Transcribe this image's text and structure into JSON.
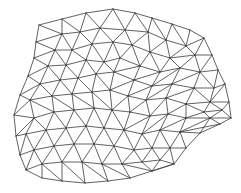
{
  "diagram": {
    "type": "triangular-mesh",
    "stroke_color": "#3a3a3a",
    "background": "#ffffff",
    "vertices": [
      [
        39,
        25
      ],
      [
        62,
        19
      ],
      [
        86,
        13
      ],
      [
        113,
        9
      ],
      [
        135,
        13
      ],
      [
        152,
        18
      ],
      [
        172,
        24
      ],
      [
        190,
        30
      ],
      [
        204,
        38
      ],
      [
        212,
        55
      ],
      [
        218,
        70
      ],
      [
        225,
        84
      ],
      [
        229,
        102
      ],
      [
        231,
        118
      ],
      [
        220,
        124
      ],
      [
        200,
        133
      ],
      [
        186,
        148
      ],
      [
        174,
        164
      ],
      [
        152,
        171
      ],
      [
        130,
        178
      ],
      [
        108,
        181
      ],
      [
        85,
        183
      ],
      [
        62,
        181
      ],
      [
        42,
        178
      ],
      [
        26,
        170
      ],
      [
        20,
        155
      ],
      [
        16,
        136
      ],
      [
        14,
        115
      ],
      [
        20,
        95
      ],
      [
        28,
        76
      ],
      [
        34,
        58
      ],
      [
        36,
        42
      ],
      [
        62,
        34
      ],
      [
        80,
        32
      ],
      [
        100,
        28
      ],
      [
        125,
        30
      ],
      [
        148,
        32
      ],
      [
        166,
        40
      ],
      [
        186,
        46
      ],
      [
        55,
        50
      ],
      [
        72,
        50
      ],
      [
        92,
        44
      ],
      [
        113,
        42
      ],
      [
        132,
        45
      ],
      [
        150,
        52
      ],
      [
        170,
        58
      ],
      [
        195,
        55
      ],
      [
        48,
        66
      ],
      [
        66,
        65
      ],
      [
        86,
        60
      ],
      [
        104,
        62
      ],
      [
        120,
        58
      ],
      [
        140,
        66
      ],
      [
        160,
        72
      ],
      [
        180,
        68
      ],
      [
        200,
        72
      ],
      [
        214,
        88
      ],
      [
        40,
        84
      ],
      [
        60,
        80
      ],
      [
        78,
        78
      ],
      [
        96,
        74
      ],
      [
        114,
        72
      ],
      [
        134,
        80
      ],
      [
        152,
        86
      ],
      [
        172,
        84
      ],
      [
        194,
        88
      ],
      [
        210,
        102
      ],
      [
        30,
        100
      ],
      [
        52,
        96
      ],
      [
        72,
        94
      ],
      [
        92,
        92
      ],
      [
        110,
        90
      ],
      [
        128,
        96
      ],
      [
        146,
        100
      ],
      [
        166,
        98
      ],
      [
        186,
        104
      ],
      [
        204,
        112
      ],
      [
        222,
        110
      ],
      [
        34,
        118
      ],
      [
        54,
        112
      ],
      [
        74,
        110
      ],
      [
        94,
        108
      ],
      [
        112,
        110
      ],
      [
        130,
        112
      ],
      [
        150,
        116
      ],
      [
        168,
        114
      ],
      [
        186,
        118
      ],
      [
        210,
        118
      ],
      [
        26,
        134
      ],
      [
        46,
        130
      ],
      [
        66,
        128
      ],
      [
        86,
        126
      ],
      [
        104,
        128
      ],
      [
        124,
        130
      ],
      [
        142,
        134
      ],
      [
        160,
        130
      ],
      [
        180,
        132
      ],
      [
        34,
        150
      ],
      [
        54,
        146
      ],
      [
        74,
        144
      ],
      [
        94,
        144
      ],
      [
        114,
        146
      ],
      [
        134,
        150
      ],
      [
        152,
        148
      ],
      [
        170,
        148
      ],
      [
        42,
        164
      ],
      [
        62,
        162
      ],
      [
        82,
        162
      ],
      [
        102,
        164
      ],
      [
        122,
        164
      ],
      [
        142,
        162
      ],
      [
        160,
        160
      ]
    ],
    "edges": [
      [
        0,
        1
      ],
      [
        1,
        2
      ],
      [
        2,
        3
      ],
      [
        3,
        4
      ],
      [
        4,
        5
      ],
      [
        5,
        6
      ],
      [
        6,
        7
      ],
      [
        7,
        8
      ],
      [
        8,
        9
      ],
      [
        9,
        10
      ],
      [
        10,
        11
      ],
      [
        11,
        12
      ],
      [
        12,
        13
      ],
      [
        13,
        14
      ],
      [
        14,
        15
      ],
      [
        15,
        16
      ],
      [
        16,
        17
      ],
      [
        17,
        18
      ],
      [
        18,
        19
      ],
      [
        19,
        20
      ],
      [
        20,
        21
      ],
      [
        21,
        22
      ],
      [
        22,
        23
      ],
      [
        23,
        24
      ],
      [
        24,
        25
      ],
      [
        25,
        26
      ],
      [
        26,
        27
      ],
      [
        27,
        28
      ],
      [
        28,
        29
      ],
      [
        29,
        30
      ],
      [
        30,
        31
      ],
      [
        31,
        0
      ],
      [
        0,
        32
      ],
      [
        1,
        32
      ],
      [
        1,
        33
      ],
      [
        2,
        33
      ],
      [
        2,
        34
      ],
      [
        3,
        34
      ],
      [
        3,
        35
      ],
      [
        4,
        35
      ],
      [
        4,
        36
      ],
      [
        5,
        36
      ],
      [
        5,
        37
      ],
      [
        6,
        37
      ],
      [
        6,
        38
      ],
      [
        7,
        38
      ],
      [
        8,
        38
      ],
      [
        8,
        46
      ],
      [
        9,
        46
      ],
      [
        32,
        33
      ],
      [
        33,
        34
      ],
      [
        34,
        35
      ],
      [
        35,
        36
      ],
      [
        36,
        37
      ],
      [
        37,
        38
      ],
      [
        38,
        46
      ],
      [
        31,
        32
      ],
      [
        31,
        39
      ],
      [
        30,
        39
      ],
      [
        32,
        39
      ],
      [
        32,
        40
      ],
      [
        33,
        40
      ],
      [
        33,
        41
      ],
      [
        34,
        41
      ],
      [
        34,
        42
      ],
      [
        35,
        42
      ],
      [
        35,
        43
      ],
      [
        36,
        43
      ],
      [
        36,
        44
      ],
      [
        37,
        44
      ],
      [
        37,
        45
      ],
      [
        38,
        45
      ],
      [
        45,
        46
      ],
      [
        39,
        40
      ],
      [
        40,
        41
      ],
      [
        41,
        42
      ],
      [
        42,
        43
      ],
      [
        43,
        44
      ],
      [
        44,
        45
      ],
      [
        30,
        47
      ],
      [
        39,
        47
      ],
      [
        39,
        48
      ],
      [
        40,
        48
      ],
      [
        40,
        49
      ],
      [
        41,
        49
      ],
      [
        41,
        50
      ],
      [
        42,
        50
      ],
      [
        42,
        51
      ],
      [
        43,
        51
      ],
      [
        43,
        52
      ],
      [
        44,
        52
      ],
      [
        44,
        53
      ],
      [
        45,
        53
      ],
      [
        45,
        54
      ],
      [
        46,
        54
      ],
      [
        46,
        55
      ],
      [
        9,
        55
      ],
      [
        10,
        55
      ],
      [
        10,
        56
      ],
      [
        55,
        56
      ],
      [
        47,
        48
      ],
      [
        48,
        49
      ],
      [
        49,
        50
      ],
      [
        50,
        51
      ],
      [
        51,
        52
      ],
      [
        52,
        53
      ],
      [
        53,
        54
      ],
      [
        54,
        55
      ],
      [
        29,
        47
      ],
      [
        29,
        57
      ],
      [
        47,
        57
      ],
      [
        47,
        58
      ],
      [
        48,
        58
      ],
      [
        48,
        59
      ],
      [
        49,
        59
      ],
      [
        49,
        60
      ],
      [
        50,
        60
      ],
      [
        50,
        61
      ],
      [
        51,
        61
      ],
      [
        52,
        61
      ],
      [
        52,
        62
      ],
      [
        53,
        62
      ],
      [
        53,
        63
      ],
      [
        54,
        63
      ],
      [
        54,
        64
      ],
      [
        55,
        64
      ],
      [
        55,
        65
      ],
      [
        56,
        65
      ],
      [
        56,
        66
      ],
      [
        11,
        56
      ],
      [
        11,
        66
      ],
      [
        12,
        66
      ],
      [
        57,
        58
      ],
      [
        58,
        59
      ],
      [
        59,
        60
      ],
      [
        60,
        61
      ],
      [
        61,
        62
      ],
      [
        62,
        63
      ],
      [
        63,
        64
      ],
      [
        64,
        65
      ],
      [
        65,
        66
      ],
      [
        28,
        57
      ],
      [
        28,
        67
      ],
      [
        57,
        67
      ],
      [
        57,
        68
      ],
      [
        58,
        68
      ],
      [
        58,
        69
      ],
      [
        59,
        69
      ],
      [
        59,
        70
      ],
      [
        60,
        70
      ],
      [
        60,
        71
      ],
      [
        61,
        71
      ],
      [
        62,
        71
      ],
      [
        62,
        72
      ],
      [
        63,
        72
      ],
      [
        63,
        73
      ],
      [
        64,
        73
      ],
      [
        64,
        74
      ],
      [
        65,
        74
      ],
      [
        65,
        75
      ],
      [
        66,
        75
      ],
      [
        66,
        76
      ],
      [
        66,
        77
      ],
      [
        12,
        77
      ],
      [
        76,
        77
      ],
      [
        67,
        68
      ],
      [
        68,
        69
      ],
      [
        69,
        70
      ],
      [
        70,
        71
      ],
      [
        71,
        72
      ],
      [
        72,
        73
      ],
      [
        73,
        74
      ],
      [
        74,
        75
      ],
      [
        75,
        76
      ],
      [
        27,
        67
      ],
      [
        27,
        78
      ],
      [
        67,
        78
      ],
      [
        67,
        79
      ],
      [
        68,
        79
      ],
      [
        68,
        80
      ],
      [
        69,
        80
      ],
      [
        69,
        81
      ],
      [
        70,
        81
      ],
      [
        70,
        82
      ],
      [
        71,
        82
      ],
      [
        72,
        82
      ],
      [
        72,
        83
      ],
      [
        73,
        83
      ],
      [
        73,
        84
      ],
      [
        74,
        84
      ],
      [
        74,
        85
      ],
      [
        75,
        85
      ],
      [
        75,
        86
      ],
      [
        76,
        86
      ],
      [
        76,
        87
      ],
      [
        77,
        87
      ],
      [
        13,
        87
      ],
      [
        13,
        77
      ],
      [
        14,
        87
      ],
      [
        78,
        79
      ],
      [
        79,
        80
      ],
      [
        80,
        81
      ],
      [
        81,
        82
      ],
      [
        82,
        83
      ],
      [
        83,
        84
      ],
      [
        84,
        85
      ],
      [
        85,
        86
      ],
      [
        86,
        87
      ],
      [
        26,
        78
      ],
      [
        26,
        88
      ],
      [
        78,
        88
      ],
      [
        78,
        89
      ],
      [
        79,
        89
      ],
      [
        79,
        90
      ],
      [
        80,
        90
      ],
      [
        80,
        91
      ],
      [
        81,
        91
      ],
      [
        81,
        92
      ],
      [
        82,
        92
      ],
      [
        82,
        93
      ],
      [
        83,
        93
      ],
      [
        84,
        93
      ],
      [
        84,
        94
      ],
      [
        85,
        94
      ],
      [
        85,
        95
      ],
      [
        86,
        95
      ],
      [
        86,
        96
      ],
      [
        87,
        96
      ],
      [
        14,
        96
      ],
      [
        15,
        96
      ],
      [
        15,
        87
      ],
      [
        88,
        89
      ],
      [
        89,
        90
      ],
      [
        90,
        91
      ],
      [
        91,
        92
      ],
      [
        92,
        93
      ],
      [
        93,
        94
      ],
      [
        94,
        95
      ],
      [
        95,
        96
      ],
      [
        25,
        88
      ],
      [
        25,
        97
      ],
      [
        88,
        97
      ],
      [
        89,
        97
      ],
      [
        89,
        98
      ],
      [
        90,
        98
      ],
      [
        90,
        99
      ],
      [
        91,
        99
      ],
      [
        91,
        100
      ],
      [
        92,
        100
      ],
      [
        92,
        101
      ],
      [
        93,
        101
      ],
      [
        93,
        102
      ],
      [
        94,
        102
      ],
      [
        94,
        103
      ],
      [
        95,
        103
      ],
      [
        95,
        104
      ],
      [
        96,
        104
      ],
      [
        16,
        96
      ],
      [
        16,
        104
      ],
      [
        97,
        98
      ],
      [
        98,
        99
      ],
      [
        99,
        100
      ],
      [
        100,
        101
      ],
      [
        101,
        102
      ],
      [
        102,
        103
      ],
      [
        103,
        104
      ],
      [
        24,
        97
      ],
      [
        24,
        105
      ],
      [
        97,
        105
      ],
      [
        98,
        105
      ],
      [
        98,
        106
      ],
      [
        99,
        106
      ],
      [
        99,
        107
      ],
      [
        100,
        107
      ],
      [
        100,
        108
      ],
      [
        101,
        108
      ],
      [
        101,
        109
      ],
      [
        102,
        109
      ],
      [
        102,
        110
      ],
      [
        103,
        110
      ],
      [
        103,
        111
      ],
      [
        104,
        111
      ],
      [
        17,
        104
      ],
      [
        17,
        111
      ],
      [
        105,
        106
      ],
      [
        106,
        107
      ],
      [
        107,
        108
      ],
      [
        108,
        109
      ],
      [
        109,
        110
      ],
      [
        110,
        111
      ],
      [
        23,
        105
      ],
      [
        22,
        105
      ],
      [
        22,
        106
      ],
      [
        21,
        106
      ],
      [
        21,
        107
      ],
      [
        20,
        107
      ],
      [
        20,
        108
      ],
      [
        19,
        108
      ],
      [
        19,
        109
      ],
      [
        18,
        109
      ],
      [
        18,
        110
      ],
      [
        18,
        111
      ],
      [
        17,
        18
      ]
    ]
  }
}
